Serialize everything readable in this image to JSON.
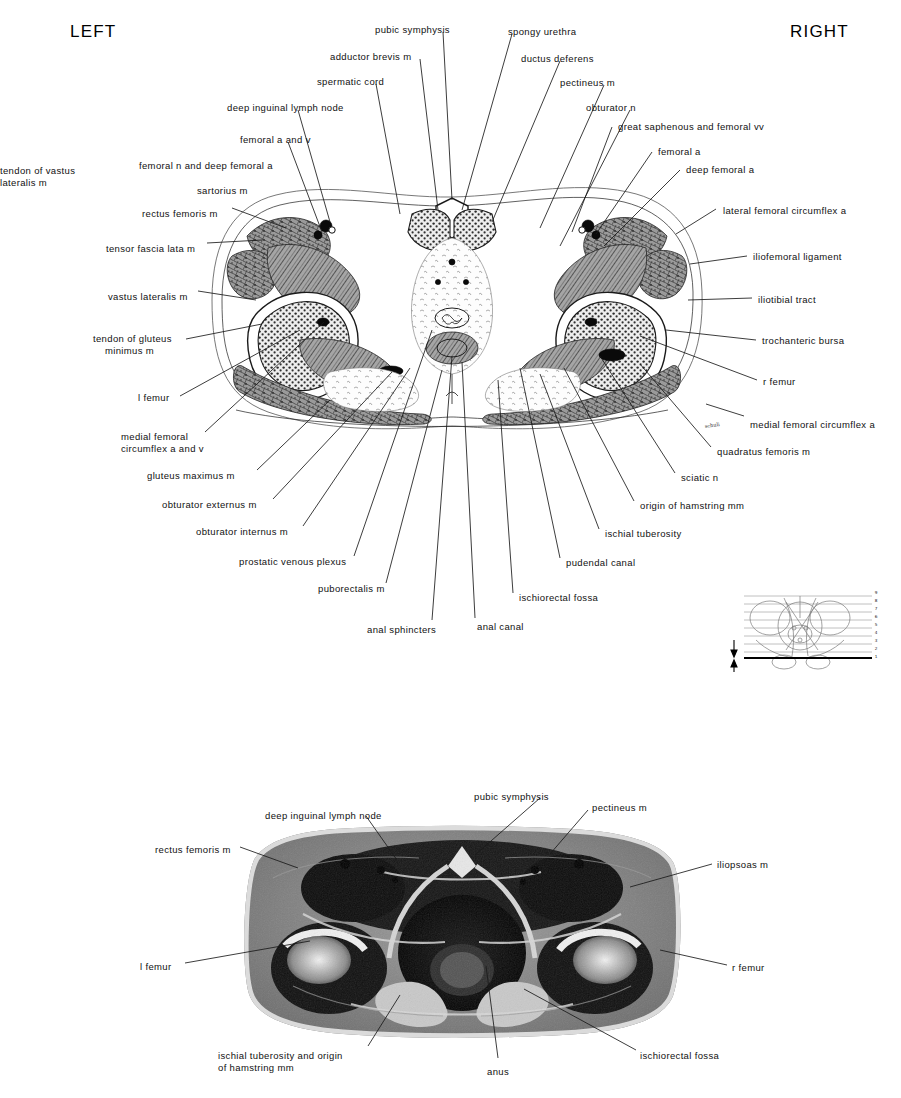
{
  "page": {
    "side_left": "LEFT",
    "side_right": "RIGHT"
  },
  "figure_top": {
    "type": "anatomical-cross-section-illustration",
    "description": "Transverse section through the male pelvis at the level of the pubic symphysis and hip joints",
    "labels_left": [
      {
        "text": "tendon of vastus\nlateralis m",
        "x": 0,
        "y": 165,
        "align": "left"
      },
      {
        "text": "femoral n and deep femoral a",
        "x": 139,
        "y": 160,
        "align": "left"
      },
      {
        "text": "sartorius m",
        "x": 197,
        "y": 185,
        "align": "left"
      },
      {
        "text": "rectus femoris m",
        "x": 142,
        "y": 208,
        "align": "left"
      },
      {
        "text": "tensor fascia lata m",
        "x": 106,
        "y": 243,
        "align": "left"
      },
      {
        "text": "vastus lateralis m",
        "x": 108,
        "y": 291,
        "align": "left"
      },
      {
        "text": "tendon of gluteus\n    minimus m",
        "x": 93,
        "y": 333,
        "align": "left"
      },
      {
        "text": "l femur",
        "x": 138,
        "y": 392,
        "align": "left"
      },
      {
        "text": "medial femoral\ncircumflex a and v",
        "x": 121,
        "y": 431,
        "align": "left"
      },
      {
        "text": "gluteus maximus m",
        "x": 147,
        "y": 470,
        "align": "left"
      },
      {
        "text": "obturator externus m",
        "x": 162,
        "y": 499,
        "align": "left"
      },
      {
        "text": "obturator internus m",
        "x": 196,
        "y": 526,
        "align": "left"
      },
      {
        "text": "prostatic venous plexus",
        "x": 239,
        "y": 556,
        "align": "left"
      },
      {
        "text": "puborectalis m",
        "x": 318,
        "y": 583,
        "align": "left"
      },
      {
        "text": "anal sphincters",
        "x": 367,
        "y": 624,
        "align": "left"
      }
    ],
    "labels_top": [
      {
        "text": "deep inguinal lymph node",
        "x": 227,
        "y": 102,
        "align": "left"
      },
      {
        "text": "femoral a and v",
        "x": 240,
        "y": 134,
        "align": "left"
      },
      {
        "text": "spermatic cord",
        "x": 317,
        "y": 76,
        "align": "left"
      },
      {
        "text": "adductor brevis m",
        "x": 330,
        "y": 51,
        "align": "left"
      },
      {
        "text": "pubic symphysis",
        "x": 375,
        "y": 24,
        "align": "left"
      },
      {
        "text": "spongy urethra",
        "x": 508,
        "y": 26,
        "align": "left"
      },
      {
        "text": "ductus deferens",
        "x": 521,
        "y": 53,
        "align": "left"
      },
      {
        "text": "pectineus m",
        "x": 560,
        "y": 77,
        "align": "left"
      },
      {
        "text": "obturator n",
        "x": 586,
        "y": 102,
        "align": "left"
      }
    ],
    "labels_right": [
      {
        "text": "great saphenous and femoral vv",
        "x": 618,
        "y": 121,
        "align": "left"
      },
      {
        "text": "femoral a",
        "x": 658,
        "y": 146,
        "align": "left"
      },
      {
        "text": "deep femoral a",
        "x": 686,
        "y": 164,
        "align": "left"
      },
      {
        "text": "lateral femoral circumflex a",
        "x": 723,
        "y": 205,
        "align": "left"
      },
      {
        "text": "iliofemoral ligament",
        "x": 753,
        "y": 251,
        "align": "left"
      },
      {
        "text": "iliotibial tract",
        "x": 758,
        "y": 294,
        "align": "left"
      },
      {
        "text": "trochanteric bursa",
        "x": 762,
        "y": 335,
        "align": "left"
      },
      {
        "text": "r femur",
        "x": 763,
        "y": 376,
        "align": "left"
      },
      {
        "text": "medial femoral circumflex a",
        "x": 750,
        "y": 419,
        "align": "left"
      },
      {
        "text": "quadratus femoris m",
        "x": 717,
        "y": 446,
        "align": "left"
      },
      {
        "text": "sciatic n",
        "x": 681,
        "y": 472,
        "align": "left"
      },
      {
        "text": "origin of hamstring mm",
        "x": 640,
        "y": 500,
        "align": "left"
      },
      {
        "text": "ischial tuberosity",
        "x": 605,
        "y": 528,
        "align": "left"
      },
      {
        "text": "pudendal canal",
        "x": 566,
        "y": 557,
        "align": "left"
      },
      {
        "text": "ischiorectal fossa",
        "x": 519,
        "y": 592,
        "align": "left"
      },
      {
        "text": "anal canal",
        "x": 477,
        "y": 621,
        "align": "left"
      }
    ]
  },
  "key_figure": {
    "description": "Small pelvis key diagram with horizontal section-level lines; current level marked by arrows",
    "scale_numbers": [
      "9",
      "8",
      "7",
      "6",
      "5",
      "4",
      "3",
      "2",
      "1"
    ]
  },
  "figure_bottom": {
    "type": "anatomical-photograph",
    "description": "Cadaver transverse section photograph of the male pelvis at the same level",
    "labels": [
      {
        "text": "deep inguinal lymph node",
        "x": 265,
        "y": 810,
        "align": "left"
      },
      {
        "text": "pubic symphysis",
        "x": 474,
        "y": 791,
        "align": "left"
      },
      {
        "text": "pectineus m",
        "x": 592,
        "y": 802,
        "align": "left"
      },
      {
        "text": "rectus femoris m",
        "x": 155,
        "y": 844,
        "align": "left"
      },
      {
        "text": "iliopsoas m",
        "x": 717,
        "y": 859,
        "align": "left"
      },
      {
        "text": "l femur",
        "x": 140,
        "y": 961,
        "align": "left"
      },
      {
        "text": "r femur",
        "x": 732,
        "y": 962,
        "align": "left"
      },
      {
        "text": "ischial tuberosity and origin\nof hamstring mm",
        "x": 218,
        "y": 1050,
        "align": "left"
      },
      {
        "text": "anus",
        "x": 487,
        "y": 1066,
        "align": "left"
      },
      {
        "text": "ischiorectal fossa",
        "x": 640,
        "y": 1050,
        "align": "left"
      }
    ]
  },
  "colors": {
    "ink": "#1a1a1a",
    "paper": "#ffffff",
    "muscle": "#8e8e8e",
    "bone": "#d8d8d8",
    "vessel": "#0a0a0a"
  }
}
